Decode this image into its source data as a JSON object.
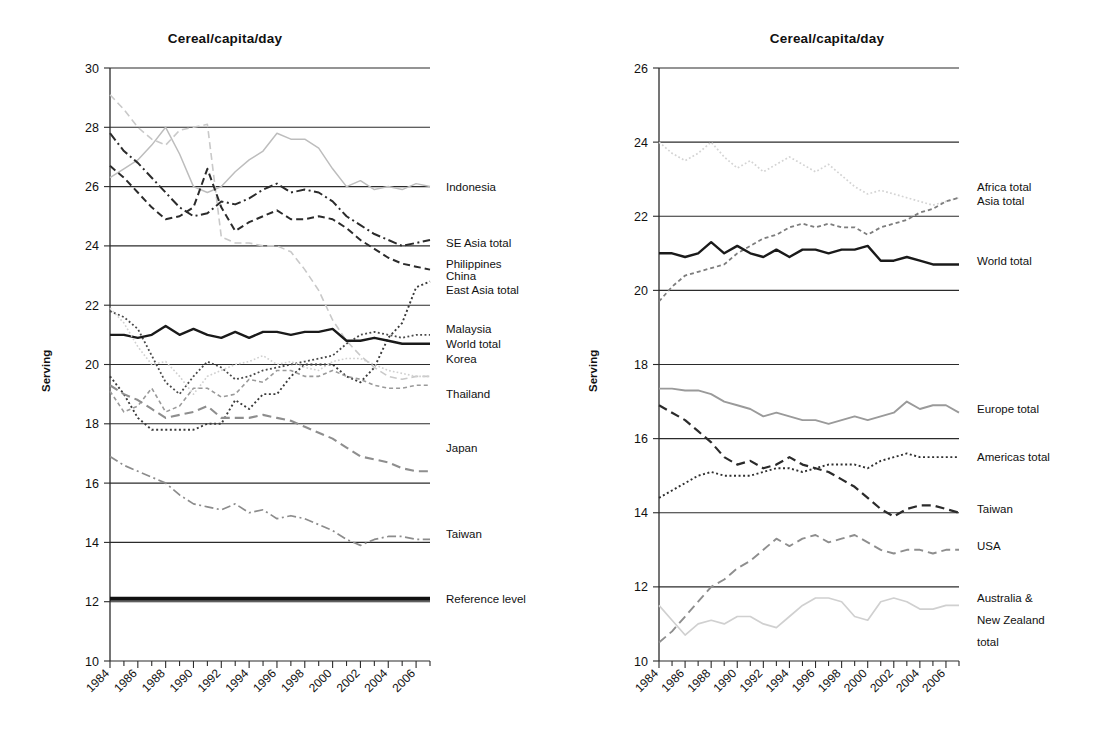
{
  "figure": {
    "panels": [
      "left",
      "right"
    ],
    "shared_xlabel": "",
    "ylabel": "Serving"
  },
  "left": {
    "title": "Cereal/capita/day",
    "ylabel": "Serving",
    "ytick_labels": [
      "30",
      "28",
      "26",
      "24",
      "22",
      "20",
      "18",
      "16",
      "14",
      "12",
      "10"
    ],
    "xtick_labels": [
      "1984",
      "1986",
      "1988",
      "1990",
      "1992",
      "1994",
      "1996",
      "1998",
      "2000",
      "2002",
      "2004",
      "2006"
    ],
    "legend_labels": [
      "Indonesia",
      "SE Asia total",
      "Philippines",
      "China",
      "East Asia total",
      "Malaysia",
      "World total",
      "Korea",
      "Thailand",
      "Japan",
      "Taiwan",
      "Reference level"
    ]
  },
  "right": {
    "title": "Cereal/capita/day",
    "ylabel": "Serving",
    "ytick_labels": [
      "26",
      "24",
      "22",
      "20",
      "18",
      "16",
      "14",
      "12",
      "10"
    ],
    "xtick_labels": [
      "1984",
      "1986",
      "1988",
      "1990",
      "1992",
      "1994",
      "1996",
      "1998",
      "2000",
      "2002",
      "2004",
      "2006"
    ],
    "legend_labels": [
      "Africa total",
      "Asia total",
      "World total",
      "Europe total",
      "Americas total",
      "Taiwan",
      "USA",
      "Australia &",
      "New Zealand",
      "total"
    ]
  },
  "chart_data": [
    {
      "type": "line",
      "panel": "left",
      "title": "Cereal/capita/day",
      "xlabel": "",
      "ylabel": "Serving",
      "xlim": [
        1984,
        2007
      ],
      "ylim": [
        10,
        30
      ],
      "ytick_values": [
        10,
        12,
        14,
        16,
        18,
        20,
        22,
        24,
        26,
        28,
        30
      ],
      "xtick_values": [
        1984,
        1986,
        1988,
        1990,
        1992,
        1994,
        1996,
        1998,
        2000,
        2002,
        2004,
        2006
      ],
      "grid": "horizontal",
      "legend_position": "right-inline",
      "x": [
        1984,
        1985,
        1986,
        1987,
        1988,
        1989,
        1990,
        1991,
        1992,
        1993,
        1994,
        1995,
        1996,
        1997,
        1998,
        1999,
        2000,
        2001,
        2002,
        2003,
        2004,
        2005,
        2006,
        2007
      ],
      "series": [
        {
          "name": "Indonesia",
          "style": "dashed",
          "color": "#c9c9c9",
          "width": 1.6,
          "values": [
            29.1,
            28.6,
            28.0,
            27.6,
            27.4,
            27.9,
            28.0,
            28.1,
            24.3,
            24.1,
            24.1,
            24.0,
            24.0,
            23.8,
            23.2,
            22.5,
            21.5,
            20.8,
            20.3,
            19.9,
            19.6,
            19.5,
            19.6,
            19.6
          ]
        },
        {
          "name": "SE Asia total",
          "style": "solid",
          "color": "#bdbdbd",
          "width": 1.5,
          "values": [
            26.3,
            26.6,
            26.9,
            27.4,
            28.0,
            27.1,
            26.0,
            25.8,
            26.0,
            26.5,
            26.9,
            27.2,
            27.8,
            27.6,
            27.6,
            27.3,
            26.6,
            26.0,
            26.2,
            25.9,
            26.0,
            25.9,
            26.1,
            26.0
          ]
        },
        {
          "name": "Philippines",
          "style": "dash-dot",
          "color": "#2b2b2b",
          "width": 2.0,
          "values": [
            27.8,
            27.2,
            26.8,
            26.3,
            25.8,
            25.3,
            25.0,
            25.1,
            25.5,
            25.4,
            25.6,
            25.9,
            26.1,
            25.8,
            25.9,
            25.8,
            25.5,
            25.0,
            24.7,
            24.4,
            24.2,
            24.0,
            24.1,
            24.2
          ]
        },
        {
          "name": "China",
          "style": "dashed",
          "color": "#2b2b2b",
          "width": 2.0,
          "values": [
            26.7,
            26.3,
            25.8,
            25.3,
            24.9,
            25.0,
            25.3,
            26.6,
            25.3,
            24.5,
            24.8,
            25.0,
            25.2,
            24.9,
            24.9,
            25.0,
            24.9,
            24.6,
            24.2,
            23.9,
            23.6,
            23.4,
            23.3,
            23.2
          ]
        },
        {
          "name": "East Asia total",
          "style": "dotted",
          "color": "#3a3a3a",
          "width": 1.9,
          "values": [
            19.6,
            19.0,
            18.2,
            17.8,
            17.8,
            17.8,
            17.8,
            18.0,
            18.0,
            18.8,
            18.5,
            19.0,
            19.0,
            19.6,
            20.0,
            20.0,
            20.0,
            19.6,
            19.4,
            19.9,
            20.9,
            21.4,
            22.6,
            22.8
          ]
        },
        {
          "name": "Malaysia",
          "style": "dotted",
          "color": "#4a4a4a",
          "width": 1.8,
          "values": [
            21.8,
            21.6,
            21.2,
            20.3,
            19.4,
            19.0,
            19.6,
            20.1,
            19.9,
            19.5,
            19.6,
            19.8,
            19.9,
            20.0,
            20.1,
            20.2,
            20.3,
            20.7,
            21.0,
            21.1,
            21.0,
            20.9,
            21.0,
            21.0
          ]
        },
        {
          "name": "World total",
          "style": "solid",
          "color": "#1a1a1a",
          "width": 2.4,
          "values": [
            21.0,
            21.0,
            20.9,
            21.0,
            21.3,
            21.0,
            21.2,
            21.0,
            20.9,
            21.1,
            20.9,
            21.1,
            21.1,
            21.0,
            21.1,
            21.1,
            21.2,
            20.8,
            20.8,
            20.9,
            20.8,
            20.7,
            20.7,
            20.7
          ]
        },
        {
          "name": "Korea",
          "style": "dotted",
          "color": "#d0d0d0",
          "width": 1.6,
          "values": [
            21.9,
            21.4,
            20.6,
            20.0,
            20.1,
            19.6,
            19.0,
            19.6,
            19.8,
            20.0,
            20.1,
            20.3,
            20.0,
            20.1,
            19.9,
            19.8,
            20.1,
            20.2,
            20.2,
            20.0,
            19.8,
            19.7,
            19.6,
            19.6
          ]
        },
        {
          "name": "Thailand",
          "style": "dashed-fine",
          "color": "#9a9a9a",
          "width": 1.6,
          "values": [
            19.1,
            18.4,
            18.6,
            19.2,
            18.4,
            18.6,
            19.2,
            19.2,
            18.9,
            19.0,
            19.5,
            19.4,
            19.8,
            19.8,
            19.6,
            19.6,
            19.8,
            19.6,
            19.5,
            19.3,
            19.2,
            19.2,
            19.3,
            19.3
          ]
        },
        {
          "name": "Japan",
          "style": "long-dashed",
          "color": "#8e8e8e",
          "width": 2.1,
          "values": [
            19.3,
            19.0,
            18.8,
            18.5,
            18.2,
            18.3,
            18.4,
            18.6,
            18.2,
            18.2,
            18.2,
            18.3,
            18.2,
            18.1,
            17.9,
            17.7,
            17.5,
            17.2,
            16.9,
            16.8,
            16.7,
            16.5,
            16.4,
            16.4
          ]
        },
        {
          "name": "Taiwan",
          "style": "dash-dot",
          "color": "#8c8c8c",
          "width": 1.7,
          "values": [
            16.9,
            16.6,
            16.4,
            16.2,
            16.0,
            15.6,
            15.3,
            15.2,
            15.1,
            15.3,
            15.0,
            15.1,
            14.8,
            14.9,
            14.8,
            14.6,
            14.4,
            14.1,
            13.9,
            14.1,
            14.2,
            14.2,
            14.1,
            14.1
          ]
        },
        {
          "name": "Reference level",
          "style": "solid-thick",
          "color": "#111111",
          "width": 4.0,
          "values": [
            12.1,
            12.1,
            12.1,
            12.1,
            12.1,
            12.1,
            12.1,
            12.1,
            12.1,
            12.1,
            12.1,
            12.1,
            12.1,
            12.1,
            12.1,
            12.1,
            12.1,
            12.1,
            12.1,
            12.1,
            12.1,
            12.1,
            12.1,
            12.1
          ]
        }
      ],
      "legend_entries": [
        {
          "label": "Indonesia",
          "y_value": 26.0
        },
        {
          "label": "SE Asia total",
          "y_value": 24.1
        },
        {
          "label": "Philippines",
          "y_value": 23.4
        },
        {
          "label": "China",
          "y_value": 23.0
        },
        {
          "label": "East Asia total",
          "y_value": 22.5
        },
        {
          "label": "Malaysia",
          "y_value": 21.2
        },
        {
          "label": "World total",
          "y_value": 20.7
        },
        {
          "label": "Korea",
          "y_value": 20.2
        },
        {
          "label": "Thailand",
          "y_value": 19.0
        },
        {
          "label": "Japan",
          "y_value": 17.2
        },
        {
          "label": "Taiwan",
          "y_value": 14.3
        },
        {
          "label": "Reference level",
          "y_value": 12.1
        }
      ]
    },
    {
      "type": "line",
      "panel": "right",
      "title": "Cereal/capita/day",
      "xlabel": "",
      "ylabel": "Serving",
      "xlim": [
        1984,
        2007
      ],
      "ylim": [
        10,
        26
      ],
      "ytick_values": [
        10,
        12,
        14,
        16,
        18,
        20,
        22,
        24,
        26
      ],
      "xtick_values": [
        1984,
        1986,
        1988,
        1990,
        1992,
        1994,
        1996,
        1998,
        2000,
        2002,
        2004,
        2006
      ],
      "grid": "horizontal",
      "legend_position": "right-inline",
      "x": [
        1984,
        1985,
        1986,
        1987,
        1988,
        1989,
        1990,
        1991,
        1992,
        1993,
        1994,
        1995,
        1996,
        1997,
        1998,
        1999,
        2000,
        2001,
        2002,
        2003,
        2004,
        2005,
        2006,
        2007
      ],
      "series": [
        {
          "name": "Africa total",
          "style": "dotted",
          "color": "#d4d4d4",
          "width": 1.7,
          "values": [
            24.0,
            23.7,
            23.5,
            23.7,
            24.0,
            23.6,
            23.3,
            23.5,
            23.2,
            23.4,
            23.6,
            23.4,
            23.2,
            23.4,
            23.1,
            22.8,
            22.6,
            22.7,
            22.6,
            22.5,
            22.4,
            22.3,
            22.4,
            22.5
          ]
        },
        {
          "name": "Asia total",
          "style": "dashed-fine",
          "color": "#7d7d7d",
          "width": 1.8,
          "values": [
            19.7,
            20.1,
            20.4,
            20.5,
            20.6,
            20.7,
            21.0,
            21.2,
            21.4,
            21.5,
            21.7,
            21.8,
            21.7,
            21.8,
            21.7,
            21.7,
            21.5,
            21.7,
            21.8,
            21.9,
            22.1,
            22.2,
            22.4,
            22.5
          ]
        },
        {
          "name": "World total",
          "style": "solid",
          "color": "#1a1a1a",
          "width": 2.4,
          "values": [
            21.0,
            21.0,
            20.9,
            21.0,
            21.3,
            21.0,
            21.2,
            21.0,
            20.9,
            21.1,
            20.9,
            21.1,
            21.1,
            21.0,
            21.1,
            21.1,
            21.2,
            20.8,
            20.8,
            20.9,
            20.8,
            20.7,
            20.7,
            20.7
          ]
        },
        {
          "name": "Europe total",
          "style": "solid",
          "color": "#9a9a9a",
          "width": 1.9,
          "values": [
            17.35,
            17.35,
            17.3,
            17.3,
            17.2,
            17.0,
            16.9,
            16.8,
            16.6,
            16.7,
            16.6,
            16.5,
            16.5,
            16.4,
            16.5,
            16.6,
            16.5,
            16.6,
            16.7,
            17.0,
            16.8,
            16.9,
            16.9,
            16.7
          ]
        },
        {
          "name": "Americas total",
          "style": "dotted",
          "color": "#2f2f2f",
          "width": 1.9,
          "values": [
            14.4,
            14.6,
            14.8,
            15.0,
            15.1,
            15.0,
            15.0,
            15.0,
            15.1,
            15.2,
            15.2,
            15.1,
            15.2,
            15.3,
            15.3,
            15.3,
            15.2,
            15.4,
            15.5,
            15.6,
            15.5,
            15.5,
            15.5,
            15.5
          ]
        },
        {
          "name": "Taiwan",
          "style": "long-dashed",
          "color": "#2b2b2b",
          "width": 2.2,
          "values": [
            16.9,
            16.7,
            16.5,
            16.2,
            15.9,
            15.5,
            15.3,
            15.4,
            15.2,
            15.3,
            15.5,
            15.3,
            15.2,
            15.1,
            14.9,
            14.7,
            14.4,
            14.1,
            13.9,
            14.1,
            14.2,
            14.2,
            14.1,
            14.0
          ]
        },
        {
          "name": "USA",
          "style": "long-dashed",
          "color": "#8e8e8e",
          "width": 1.9,
          "values": [
            10.5,
            10.8,
            11.2,
            11.6,
            12.0,
            12.2,
            12.5,
            12.7,
            13.0,
            13.3,
            13.1,
            13.3,
            13.4,
            13.2,
            13.3,
            13.4,
            13.2,
            13.0,
            12.9,
            13.0,
            13.0,
            12.9,
            13.0,
            13.0
          ]
        },
        {
          "name": "Australia & New Zealand total",
          "style": "solid",
          "color": "#d0d0d0",
          "width": 1.7,
          "values": [
            11.5,
            11.1,
            10.7,
            11.0,
            11.1,
            11.0,
            11.2,
            11.2,
            11.0,
            10.9,
            11.2,
            11.5,
            11.7,
            11.7,
            11.6,
            11.2,
            11.1,
            11.6,
            11.7,
            11.6,
            11.4,
            11.4,
            11.5,
            11.5
          ]
        }
      ],
      "legend_entries": [
        {
          "label": "Africa total",
          "y_value": 22.8
        },
        {
          "label": "Asia total",
          "y_value": 22.4
        },
        {
          "label": "World total",
          "y_value": 20.8
        },
        {
          "label": "Europe total",
          "y_value": 16.8
        },
        {
          "label": "Americas total",
          "y_value": 15.5
        },
        {
          "label": "Taiwan",
          "y_value": 14.1
        },
        {
          "label": "USA",
          "y_value": 13.1
        },
        {
          "label": "Australia &",
          "y_value": 11.7
        },
        {
          "label": "New Zealand",
          "y_value": 11.1
        },
        {
          "label": "total",
          "y_value": 10.5
        }
      ]
    }
  ]
}
